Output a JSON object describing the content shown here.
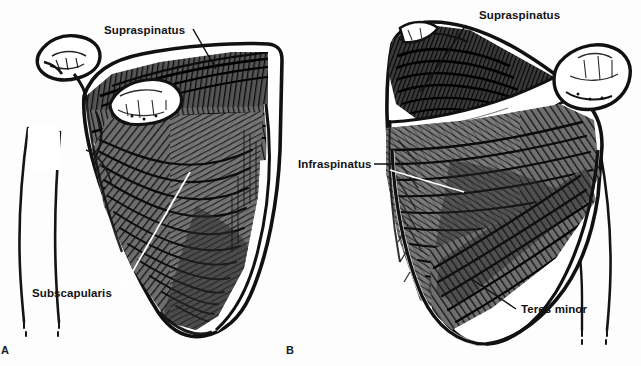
{
  "figure": {
    "background_color": "#fdfdfd",
    "ink_color": "#111111",
    "bone_color": "#ffffff",
    "panels": [
      {
        "id": "A",
        "panel_label": "A",
        "view": "anterior",
        "labels": [
          {
            "key": "supraspinatus",
            "text": "Supraspinatus"
          },
          {
            "key": "subscapularis",
            "text": "Subscapularis"
          }
        ]
      },
      {
        "id": "B",
        "panel_label": "B",
        "view": "posterior",
        "labels": [
          {
            "key": "supraspinatus",
            "text": "Supraspinatus"
          },
          {
            "key": "infraspinatus",
            "text": "Infraspinatus"
          },
          {
            "key": "teres_minor",
            "text": "Teres minor"
          }
        ]
      }
    ]
  },
  "labels": {
    "left_supraspinatus": "Supraspinatus",
    "left_subscapularis": "Subscapularis",
    "right_supraspinatus": "Supraspinatus",
    "right_infraspinatus": "Infraspinatus",
    "right_teres_minor": "Teres minor",
    "panel_a": "A",
    "panel_b": "B"
  }
}
